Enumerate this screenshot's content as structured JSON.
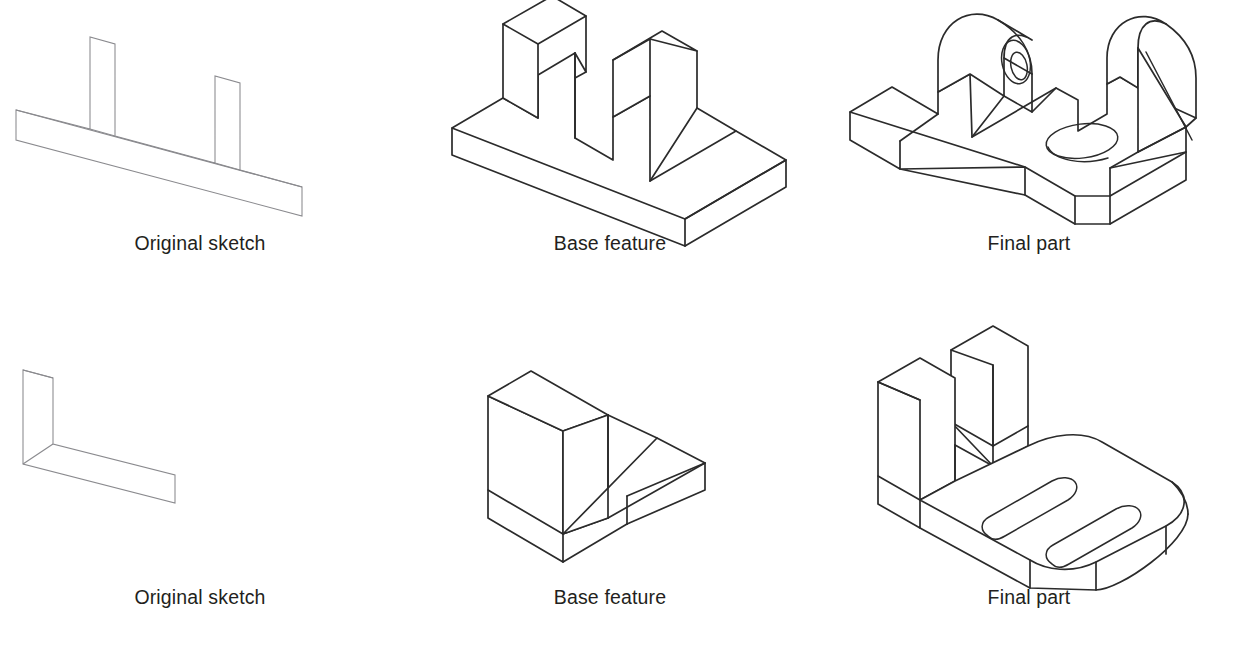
{
  "figure": {
    "background_color": "#ffffff",
    "sketch_line_color": "#8a8a8e",
    "solid_line_color": "#2b2b2b",
    "rows": [
      {
        "id": "row-top",
        "cells": [
          {
            "id": "top-original-sketch",
            "caption": "Original sketch",
            "drawing": "ribbed-plate-profile-sketch"
          },
          {
            "id": "top-base-feature",
            "caption": "Base feature",
            "drawing": "ribbed-plate-extrusion"
          },
          {
            "id": "top-final-part",
            "caption": "Final part",
            "drawing": "ribbed-plate-final"
          }
        ]
      },
      {
        "id": "row-bottom",
        "cells": [
          {
            "id": "bottom-original-sketch",
            "caption": "Original sketch",
            "drawing": "l-bracket-profile-sketch"
          },
          {
            "id": "bottom-base-feature",
            "caption": "Base feature",
            "drawing": "l-bracket-extrusion"
          },
          {
            "id": "bottom-final-part",
            "caption": "Final part",
            "drawing": "l-bracket-final"
          }
        ]
      }
    ]
  }
}
